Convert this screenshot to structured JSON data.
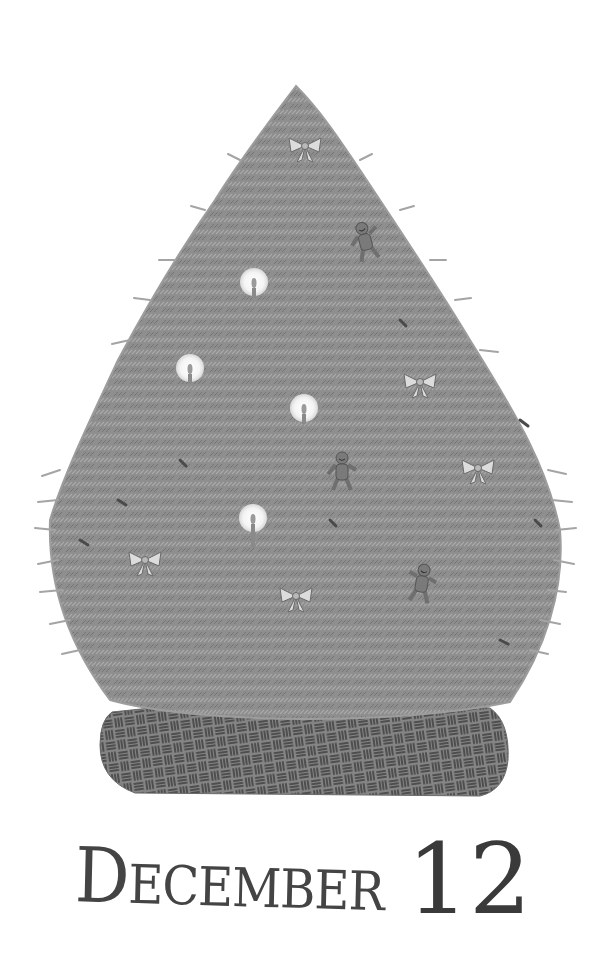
{
  "illustration": {
    "subject": "Christmas tree",
    "background": "#ffffff",
    "tree_color": "#8c8c8c",
    "tree_shadow": "#6e6e6e",
    "needle_color": "#a9a9a9",
    "skirt_color": "#7a7a7a",
    "skirt_pattern_color": "#4a4a4a"
  },
  "ornaments": {
    "candles": [
      {
        "x": 254,
        "y": 282
      },
      {
        "x": 190,
        "y": 368
      },
      {
        "x": 304,
        "y": 408
      },
      {
        "x": 253,
        "y": 518
      }
    ],
    "bows": [
      {
        "x": 305,
        "y": 146
      },
      {
        "x": 420,
        "y": 382
      },
      {
        "x": 478,
        "y": 468
      },
      {
        "x": 145,
        "y": 560
      },
      {
        "x": 296,
        "y": 596
      }
    ],
    "gingerbread_men": [
      {
        "x": 365,
        "y": 240
      },
      {
        "x": 342,
        "y": 470
      },
      {
        "x": 422,
        "y": 582
      }
    ]
  },
  "caption": {
    "month": "December",
    "day": "12"
  }
}
